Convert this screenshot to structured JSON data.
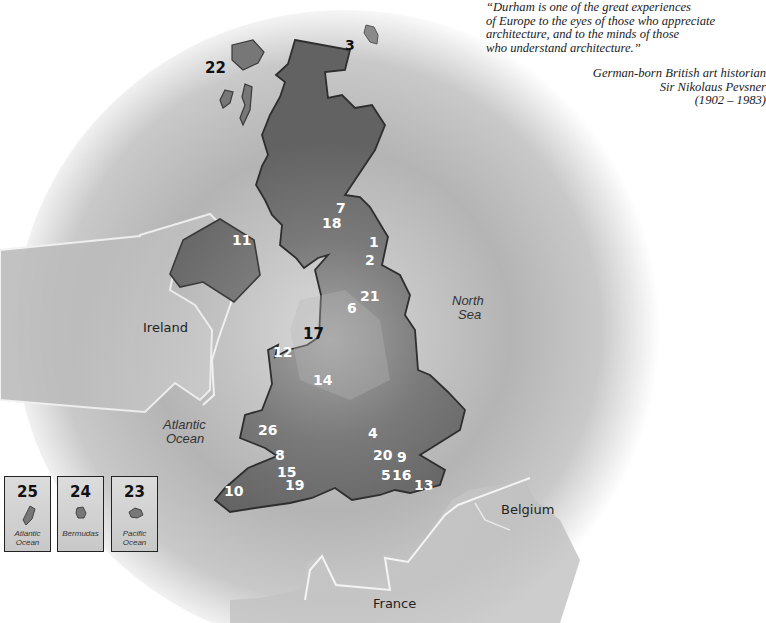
{
  "quote": {
    "lines": [
      "“Durham is one of the great experiences",
      "of Europe to the eyes of those who appreciate",
      "architecture, and to the minds of those",
      "who understand architecture.”"
    ],
    "attribution": [
      "German-born British art historian",
      "Sir Nikolaus Pevsner",
      "(1902 – 1983)"
    ]
  },
  "map": {
    "regions": {
      "ireland": "Ireland",
      "north_sea_1": "North",
      "north_sea_2": "Sea",
      "atlantic_1": "Atlantic",
      "atlantic_2": "Ocean",
      "belgium": "Belgium",
      "france": "France"
    },
    "markers": [
      {
        "id": "1",
        "label": "1"
      },
      {
        "id": "2",
        "label": "2"
      },
      {
        "id": "3",
        "label": "3"
      },
      {
        "id": "4",
        "label": "4"
      },
      {
        "id": "5",
        "label": "5"
      },
      {
        "id": "6",
        "label": "6"
      },
      {
        "id": "7",
        "label": "7"
      },
      {
        "id": "8",
        "label": "8"
      },
      {
        "id": "9",
        "label": "9"
      },
      {
        "id": "10",
        "label": "10"
      },
      {
        "id": "11",
        "label": "11"
      },
      {
        "id": "12",
        "label": "12"
      },
      {
        "id": "13",
        "label": "13"
      },
      {
        "id": "14",
        "label": "14"
      },
      {
        "id": "15",
        "label": "15"
      },
      {
        "id": "16",
        "label": "16"
      },
      {
        "id": "17",
        "label": "17"
      },
      {
        "id": "18",
        "label": "18"
      },
      {
        "id": "19",
        "label": "19"
      },
      {
        "id": "20",
        "label": "20"
      },
      {
        "id": "21",
        "label": "21"
      },
      {
        "id": "22",
        "label": "22"
      },
      {
        "id": "26",
        "label": "26"
      }
    ],
    "insets": [
      {
        "num": "25",
        "label_1": "Atlantic",
        "label_2": "Ocean"
      },
      {
        "num": "24",
        "label_1": "Bermudas",
        "label_2": ""
      },
      {
        "num": "23",
        "label_1": "Pacific",
        "label_2": "Ocean"
      }
    ]
  },
  "colors": {
    "land_dark": "#6e6e6e",
    "land_light": "#cfcfcf",
    "halo": "#a8a8a8"
  }
}
